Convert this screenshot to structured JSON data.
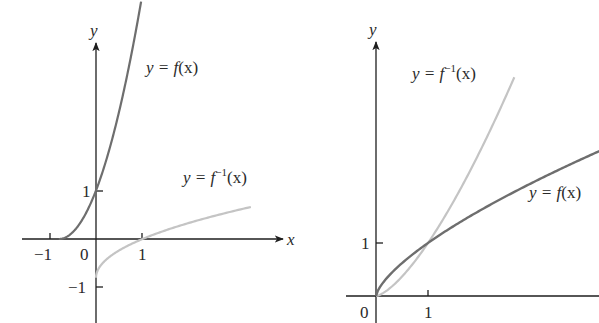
{
  "figure": {
    "left_panel": {
      "axis_labels": {
        "x": "x",
        "y": "y"
      },
      "tick_labels": {
        "x_neg1": "−1",
        "origin": "0",
        "x_pos1": "1",
        "y_pos1": "1",
        "y_neg1": "−1"
      },
      "curves": [
        {
          "name": "f",
          "label_prefix": "y = ",
          "label_func": "f",
          "label_sup": "",
          "label_arg": "(x)",
          "color": "#6e6e6e"
        },
        {
          "name": "f_inverse",
          "label_prefix": "y = ",
          "label_func": "f",
          "label_sup": "−1",
          "label_arg": "(x)",
          "color": "#c4c4c4"
        }
      ]
    },
    "right_panel": {
      "axis_labels": {
        "y": "y"
      },
      "tick_labels": {
        "origin": "0",
        "x_pos1": "1",
        "y_pos1": "1"
      },
      "curves": [
        {
          "name": "f_inverse",
          "label_prefix": "y = ",
          "label_func": "f",
          "label_sup": "−1",
          "label_arg": "(x)",
          "color": "#c4c4c4"
        },
        {
          "name": "f",
          "label_prefix": "y = ",
          "label_func": "f",
          "label_sup": "",
          "label_arg": "(x)",
          "color": "#6e6e6e"
        }
      ]
    }
  },
  "layout": {
    "left": {
      "origin_px": [
        96,
        239
      ],
      "unit_x": 46.5,
      "unit_y": 48.5,
      "f_domain": [
        -0.8,
        0.97
      ],
      "finv_domain": [
        0.0,
        3.95
      ]
    },
    "right": {
      "origin_px": [
        376,
        296
      ],
      "unit_x": 52,
      "unit_y": 53,
      "f_power": 0.69,
      "f_domain": [
        0,
        4.3
      ],
      "finv_domain": [
        0,
        2.66
      ]
    }
  }
}
